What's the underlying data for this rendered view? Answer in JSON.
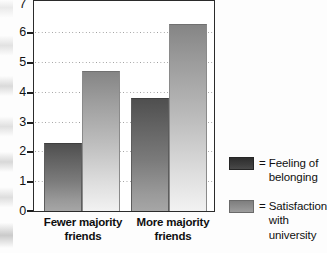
{
  "chart_data": {
    "type": "bar",
    "title": "",
    "subtitle": "",
    "xlabel": "",
    "ylabel": "",
    "categories": [
      "Fewer majority friends",
      "More majority friends"
    ],
    "series": [
      {
        "name": "Feeling of belonging",
        "values": [
          2.3,
          3.8
        ],
        "color": "#5d5d5d"
      },
      {
        "name": "Satisfaction with university",
        "values": [
          4.7,
          6.3
        ],
        "color": "#9c9c9c"
      }
    ],
    "ylim": [
      0,
      7
    ],
    "yticks": [
      0,
      1,
      2,
      3,
      4,
      5,
      6,
      7
    ],
    "ytick_labels": [
      "0",
      "1",
      "2",
      "3",
      "4",
      "5",
      "6",
      "7"
    ],
    "grid": true,
    "grid_axis": "y",
    "grid_style": "dotted",
    "legend_position": "right",
    "legend_prefix": "="
  },
  "axis": {
    "ticks": [
      {
        "label": "7",
        "value": 7
      },
      {
        "label": "6",
        "value": 6
      },
      {
        "label": "5",
        "value": 5
      },
      {
        "label": "4",
        "value": 4
      },
      {
        "label": "3",
        "value": 3
      },
      {
        "label": "2",
        "value": 2
      },
      {
        "label": "1",
        "value": 1
      },
      {
        "label": "0",
        "value": 0
      }
    ]
  },
  "categories": [
    {
      "line1": "Fewer majority",
      "line2": "friends"
    },
    {
      "line1": "More majority",
      "line2": "friends"
    }
  ],
  "legend": {
    "items": [
      {
        "equals": "=",
        "label_line1": "Feeling of",
        "label_line2": "belonging"
      },
      {
        "equals": "=",
        "label_line1": "Satisfaction",
        "label_line2": "with university"
      }
    ]
  }
}
